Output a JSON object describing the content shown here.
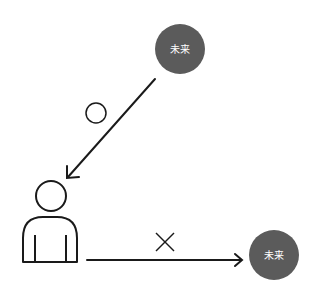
{
  "diagram": {
    "top_node": {
      "label": "未来",
      "color": "#5b5b5b"
    },
    "bottom_node": {
      "label": "未来",
      "color": "#5b5b5b"
    },
    "diagonal_arrow": {
      "mark": "circle",
      "meaning": "ok"
    },
    "horizontal_arrow": {
      "mark": "cross",
      "meaning": "ng"
    },
    "person": {
      "icon": "person-icon"
    },
    "stroke_color": "#1a1a1a"
  }
}
